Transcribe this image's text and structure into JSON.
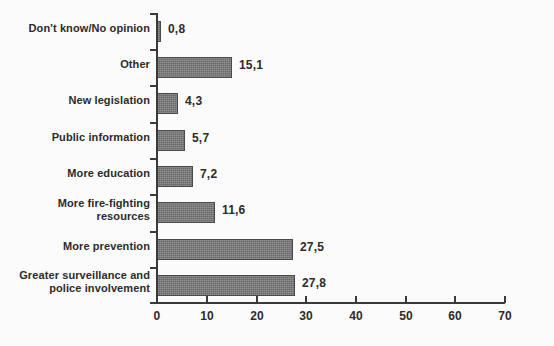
{
  "chart_data": {
    "type": "bar",
    "orientation": "horizontal",
    "title": "",
    "subtitle": "",
    "xlabel": "",
    "ylabel": "",
    "xlim": [
      0,
      70
    ],
    "xticks": [
      "0",
      "10",
      "20",
      "30",
      "40",
      "50",
      "60",
      "70"
    ],
    "grid": false,
    "legend": false,
    "decimal_separator": ",",
    "categories": [
      "Don't know/No opinion",
      "Other",
      "New legislation",
      "Public information",
      "More education",
      "More fire-fighting\nresources",
      "More prevention",
      "Greater surveillance and\npolice involvement"
    ],
    "values": [
      0.8,
      15.1,
      4.3,
      5.7,
      7.2,
      11.6,
      27.5,
      27.8
    ],
    "value_labels": [
      "0,8",
      "15,1",
      "4,3",
      "5,7",
      "7,2",
      "11,6",
      "27,5",
      "27,8"
    ],
    "series": [
      {
        "name": "",
        "values": [
          0.8,
          15.1,
          4.3,
          5.7,
          7.2,
          11.6,
          27.5,
          27.8
        ]
      }
    ],
    "colors": {
      "bar_fill": "#686868",
      "bar_edge": "#4a4a4a",
      "axis": "#3a3a3a",
      "text": "#2b2b2b",
      "background": "#fbfbfb"
    }
  }
}
